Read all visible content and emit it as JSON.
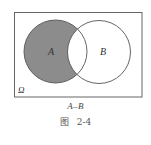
{
  "figure": {
    "type": "venn-diagram",
    "universe_label": "Ω",
    "sets": [
      {
        "name": "A",
        "label": "A",
        "shaded": true
      },
      {
        "name": "B",
        "label": "B",
        "shaded": false
      }
    ],
    "shaded_region": "A-B",
    "expression": "A–B",
    "caption_prefix": "图",
    "caption_number": "2-4",
    "colors": {
      "shade": "#8c8c8c",
      "stroke": "#555555",
      "background": "#ffffff"
    }
  }
}
